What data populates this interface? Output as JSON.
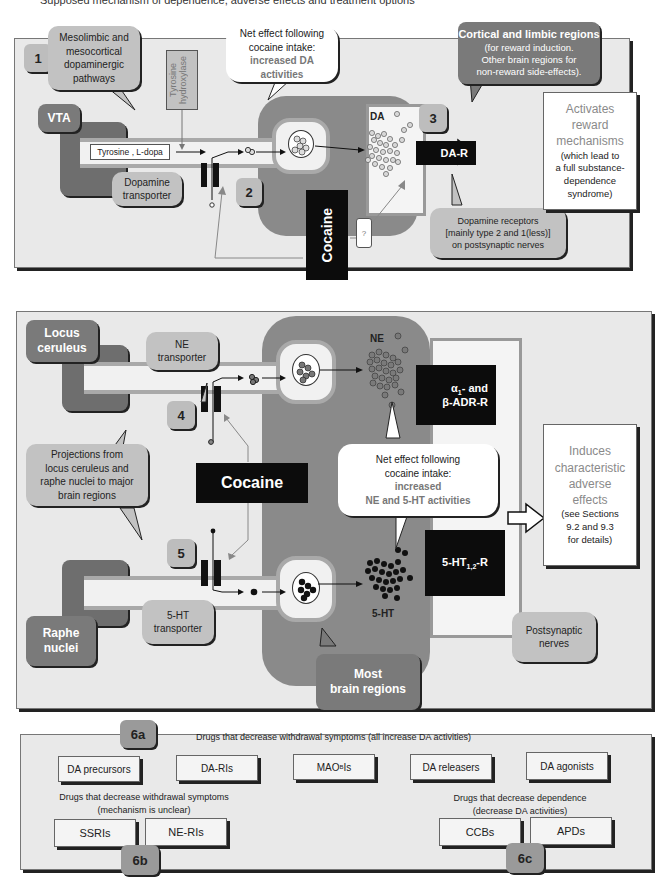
{
  "caption": "Supposed mechanism of dependence, adverse effects and treatment options",
  "panel1": {
    "step1": "1",
    "pathway_callout": [
      "Mesolimbic and",
      "mesocortical",
      "dopaminergic",
      "pathways"
    ],
    "enzyme_label": "Tyrosine hydroxylase",
    "net_effect": {
      "line1": "Net effect following",
      "line2": "cocaine intake:",
      "line3": "increased DA",
      "line4": "activities"
    },
    "region_callout": {
      "title": "Cortical and limbic regions",
      "line1": "(for reward induction.",
      "line2": "Other brain regions for",
      "line3": "non-reward side-effects)."
    },
    "vta_label": "VTA",
    "precursor_label": "Tyrosine , L-dopa",
    "transporter_callout": [
      "Dopamine",
      "transporter"
    ],
    "step2": "2",
    "step3": "3",
    "neurotransmitter": "DA",
    "receptor": "DA-R",
    "cocaine_label": "Cocaine",
    "question_mark": "?",
    "receptor_callout": [
      "Dopamine receptors",
      "[mainly type 2 and 1(less)]",
      "on postsynaptic nerves"
    ],
    "outcome": {
      "line1": "Activates",
      "line2": "reward",
      "line3": "mechanisms",
      "line4": "(which lead to",
      "line5": "a full substance-",
      "line6": "dependence",
      "line7": "syndrome)"
    }
  },
  "panel2": {
    "locus_label": [
      "Locus",
      "ceruleus"
    ],
    "ne_transporter": [
      "NE",
      "transporter"
    ],
    "step4": "4",
    "step5": "5",
    "projection_callout": [
      "Projections from",
      "locus ceruleus and",
      "raphe nuclei to major",
      "brain regions"
    ],
    "cocaine_label": "Cocaine",
    "net_effect": {
      "line1": "Net effect following",
      "line2": "cocaine intake:",
      "line3": "increased",
      "line4": "NE and 5-HT activities"
    },
    "ne_label": "NE",
    "ne_receptor": {
      "line1_prefix": "α",
      "line1_sub": "1",
      "line1_suffix": "- and",
      "line2": "β-ADR-R"
    },
    "ht_receptor": {
      "prefix": "5-HT",
      "sub": "1,2",
      "suffix": "-R"
    },
    "ht_label": "5-HT",
    "ht_transporter": [
      "5-HT",
      "transporter"
    ],
    "raphe_label": [
      "Raphe",
      "nuclei"
    ],
    "postsynaptic_callout": [
      "Postsynaptic",
      "nerves"
    ],
    "most_regions": [
      "Most",
      "brain regions"
    ],
    "outcome": {
      "line1": "Induces",
      "line2": "characteristic",
      "line3": "adverse",
      "line4": "effects",
      "line5": "(see Sections",
      "line6": "9.2 and 9.3",
      "line7": "for details)"
    }
  },
  "panel3": {
    "badge_6a": "6a",
    "heading_6a": "Drugs that decrease withdrawal symptoms (all increase DA activities)",
    "drugs_6a": [
      {
        "label": "DA precursors"
      },
      {
        "label": "DA-RIs"
      },
      {
        "label_prefix": "MAO",
        "label_sub": "B",
        "label_suffix": "Is"
      },
      {
        "label": "DA releasers"
      },
      {
        "label": "DA agonists"
      }
    ],
    "heading_6b": [
      "Drugs that decrease withdrawal symptoms",
      "(mechanism is unclear)"
    ],
    "drugs_6b": [
      "SSRIs",
      "NE-RIs"
    ],
    "badge_6b": "6b",
    "heading_6c": [
      "Drugs that decrease dependence",
      "(decrease DA activities)"
    ],
    "drugs_6c": [
      "CCBs",
      "APDs"
    ],
    "badge_6c": "6c"
  }
}
